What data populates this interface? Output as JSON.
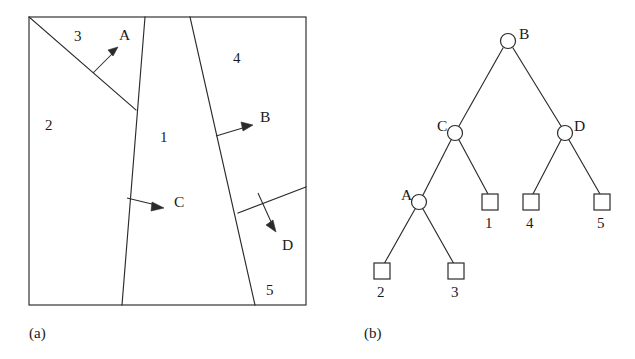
{
  "figure": {
    "panels": [
      {
        "id": "a",
        "caption": "(a)",
        "type": "partition-diagram",
        "region_labels": [
          {
            "text": "1",
            "x": 160,
            "y": 137
          },
          {
            "text": "2",
            "x": 45,
            "y": 125
          },
          {
            "text": "3",
            "x": 74,
            "y": 36
          },
          {
            "text": "4",
            "x": 233,
            "y": 58
          },
          {
            "text": "5",
            "x": 266,
            "y": 290
          }
        ],
        "split_labels": [
          {
            "text": "A",
            "x": 119,
            "y": 34
          },
          {
            "text": "B",
            "x": 260,
            "y": 116
          },
          {
            "text": "C",
            "x": 174,
            "y": 201
          },
          {
            "text": "D",
            "x": 282,
            "y": 244
          }
        ]
      },
      {
        "id": "b",
        "caption": "(b)",
        "type": "bsp-tree",
        "internal_nodes": [
          {
            "label": "B",
            "x": 508,
            "y": 41,
            "label_side": "right"
          },
          {
            "label": "C",
            "x": 455,
            "y": 133,
            "label_side": "left"
          },
          {
            "label": "D",
            "x": 565,
            "y": 133,
            "label_side": "right"
          },
          {
            "label": "A",
            "x": 419,
            "y": 202,
            "label_side": "left"
          }
        ],
        "leaf_nodes": [
          {
            "label": "1",
            "x": 490,
            "y": 202
          },
          {
            "label": "4",
            "x": 531,
            "y": 202
          },
          {
            "label": "5",
            "x": 602,
            "y": 202
          },
          {
            "label": "2",
            "x": 382,
            "y": 271
          },
          {
            "label": "3",
            "x": 456,
            "y": 271
          }
        ],
        "edges": [
          {
            "from": "B",
            "to": "C"
          },
          {
            "from": "B",
            "to": "D"
          },
          {
            "from": "C",
            "to": "A"
          },
          {
            "from": "C",
            "to": "1"
          },
          {
            "from": "D",
            "to": "4"
          },
          {
            "from": "D",
            "to": "5"
          },
          {
            "from": "A",
            "to": "2"
          },
          {
            "from": "A",
            "to": "3"
          }
        ]
      }
    ],
    "colors": {
      "ink": "#2b2b2b",
      "background": "#ffffff"
    }
  }
}
